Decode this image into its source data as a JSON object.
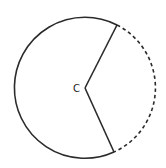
{
  "diagram": {
    "center": {
      "label": "C",
      "x": 85,
      "y": 88
    },
    "radius": 70.5,
    "radii_endpoints": [
      {
        "x": 117,
        "y": 25
      },
      {
        "x": 114,
        "y": 152
      }
    ],
    "major_arc": {
      "style": "solid"
    },
    "minor_arc": {
      "style": "dashed"
    },
    "colors": {
      "stroke": "#2a2a2a",
      "background": "#ffffff"
    }
  }
}
